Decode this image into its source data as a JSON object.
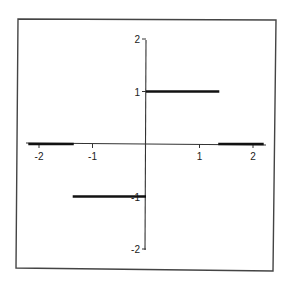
{
  "chart_data": {
    "type": "line",
    "title": "",
    "xlabel": "",
    "ylabel": "",
    "xlim": [
      -2.3,
      2.3
    ],
    "ylim": [
      -2,
      2
    ],
    "grid": false,
    "legend": null,
    "x_ticks": [
      -2,
      -1,
      1,
      2
    ],
    "x_tick_labels": [
      "-2",
      "-1",
      "1",
      "2"
    ],
    "y_ticks": [
      2,
      1,
      -1,
      -2
    ],
    "y_tick_labels": [
      "2",
      "1",
      "-1",
      "-2"
    ],
    "axes_style": "centered axes crossing at origin, boxed frame",
    "series": [
      {
        "name": "piecewise function",
        "style": "thick horizontal segments",
        "segments": [
          {
            "x": [
              -2.2,
              -1.35
            ],
            "y": [
              0,
              0
            ]
          },
          {
            "x": [
              -1.37,
              0
            ],
            "y": [
              -1,
              -1
            ]
          },
          {
            "x": [
              0,
              1.37
            ],
            "y": [
              1,
              1
            ]
          },
          {
            "x": [
              1.35,
              2.2
            ],
            "y": [
              0,
              0
            ]
          }
        ]
      }
    ]
  },
  "colors": {
    "background": "#ffffff",
    "frame": "#444444",
    "axis": "#333333",
    "segment": "#111111",
    "text": "#222222"
  }
}
